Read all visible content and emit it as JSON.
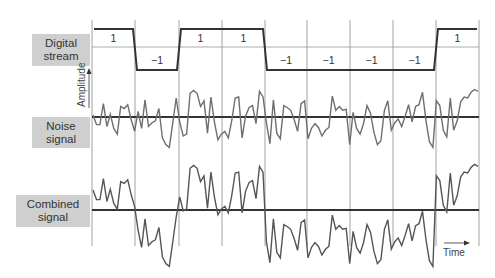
{
  "chart_data": {
    "type": "line",
    "title": "",
    "xlabel": "Time",
    "ylabel": "Amplitude",
    "grid": {
      "vertical_lines": true,
      "line_x_px": [
        92,
        135,
        179,
        222,
        265,
        307,
        350,
        393,
        436,
        479
      ]
    },
    "panels": [
      {
        "name": "Digital stream",
        "type": "step",
        "bits": [
          1,
          -1,
          1,
          1,
          -1,
          -1,
          -1,
          -1,
          1
        ],
        "bit_labels": [
          "1",
          "−1",
          "1",
          "1",
          "−1",
          "−1",
          "−1",
          "−1",
          "1"
        ]
      },
      {
        "name": "Noise signal",
        "type": "line",
        "description": "random noise around zero baseline"
      },
      {
        "name": "Combined signal",
        "type": "line",
        "description": "digital stream plus noise"
      }
    ]
  },
  "labels": {
    "digital": [
      "Digital",
      "stream"
    ],
    "noise": [
      "Noise",
      "signal"
    ],
    "combined": [
      "Combined",
      "signal"
    ],
    "amplitude": "Amplitude",
    "time": "Time"
  },
  "colors": {
    "label_bg": "#cfcfcf",
    "signal": "#6e6e6e",
    "axis": "#333333",
    "grid": "#8a8a8a"
  }
}
